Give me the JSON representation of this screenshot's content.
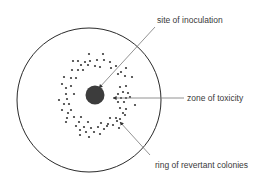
{
  "diagram": {
    "title": "",
    "labels": {
      "inoculation": "site of inoculation",
      "toxicity": "zone of toxicity",
      "revertants": "ring of revertant colonies"
    },
    "colors": {
      "plate_outline": "#2a2a2a",
      "inoculation_site": "#3c3c3c",
      "colony": "#3a3a3a",
      "leader": "#777777",
      "text": "#3a3a3a"
    }
  }
}
